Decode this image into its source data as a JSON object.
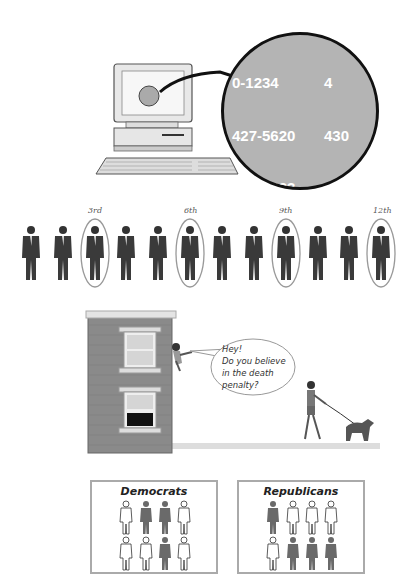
{
  "figure": {
    "sections": [
      {
        "id": "phone-list",
        "description": "Computer with magnified list of phone numbers",
        "magnifier": {
          "column1": [
            "0-1234",
            "427-5620",
            "931-9823",
            "553-1113",
            "434-6193",
            "231-0098",
            "329-0909",
            "2-1282"
          ],
          "column2": [
            "4",
            "430",
            "265-",
            "987-",
            "611-",
            "609-",
            "98",
            "9"
          ]
        }
      },
      {
        "id": "systematic-sample",
        "description": "Row of 12 people, every 3rd circled",
        "people_count": 12,
        "circled_labels": [
          "3rd",
          "6th",
          "9th",
          "12th"
        ]
      },
      {
        "id": "window-survey",
        "description": "Person leaning from a building window calling to a passer-by walking a dog",
        "speech_bubble": [
          "Hey!",
          "Do you believe",
          "in the death",
          "penalty?"
        ]
      },
      {
        "id": "party-groups",
        "panels": [
          {
            "title": "Democrats",
            "figures": [
              "outline",
              "filled",
              "filled",
              "outline",
              "outline",
              "outline",
              "filled",
              "outline"
            ]
          },
          {
            "title": "Republicans",
            "figures": [
              "filled",
              "outline",
              "outline",
              "outline",
              "outline",
              "filled",
              "filled",
              "filled"
            ]
          }
        ]
      }
    ]
  },
  "colors": {
    "brick": "#8a8a8a",
    "magnifier_bg": "#b4b4b4",
    "circle_stroke": "#999999",
    "filled_person": "#6a6a6a"
  }
}
